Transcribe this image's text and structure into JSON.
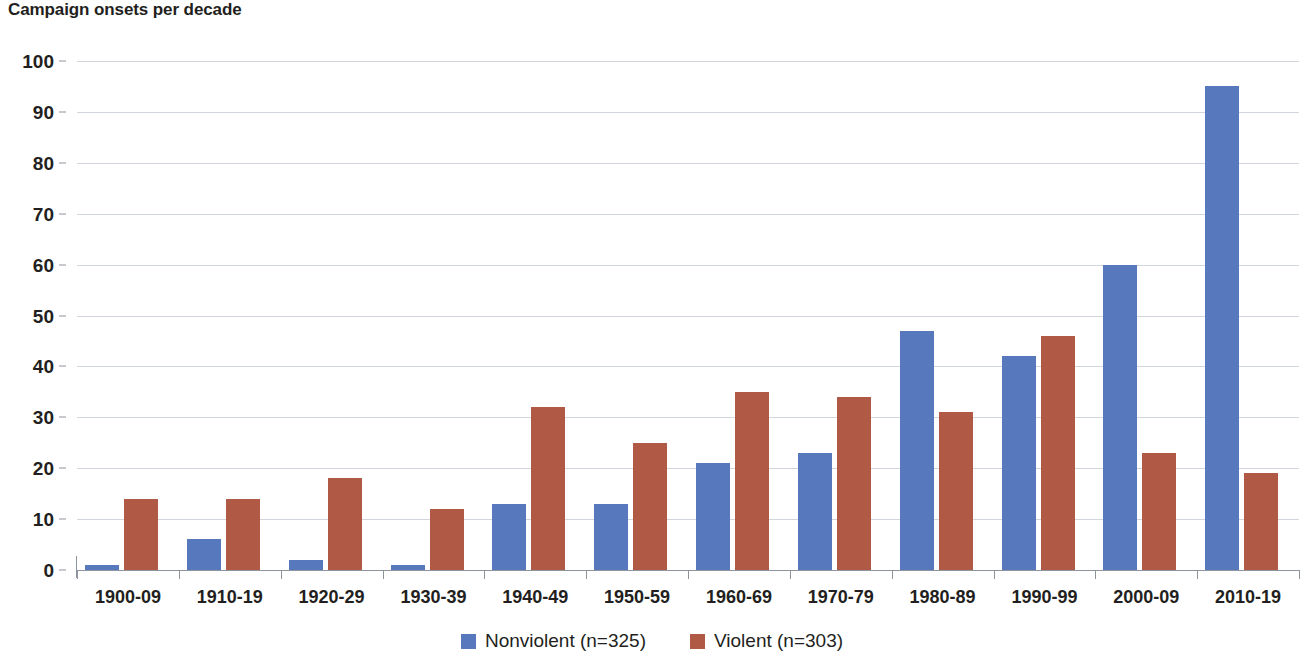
{
  "chart_data": {
    "type": "bar",
    "title": "Campaign onsets per decade",
    "xlabel": "",
    "ylabel": "",
    "ylim": [
      0,
      100
    ],
    "ytick_step": 10,
    "yticks": [
      100,
      90,
      80,
      70,
      60,
      50,
      40,
      30,
      20,
      10,
      0
    ],
    "grid": true,
    "legend_position": "bottom-center",
    "categories": [
      "1900-09",
      "1910-19",
      "1920-29",
      "1930-39",
      "1940-49",
      "1950-59",
      "1960-69",
      "1970-79",
      "1980-89",
      "1990-99",
      "2000-09",
      "2010-19"
    ],
    "series": [
      {
        "name": "Nonviolent (n=325)",
        "color": "#5878be",
        "values": [
          1,
          6,
          2,
          1,
          13,
          13,
          21,
          23,
          47,
          42,
          60,
          95
        ]
      },
      {
        "name": "Violent (n=303)",
        "color": "#b05a46",
        "values": [
          14,
          14,
          18,
          12,
          32,
          25,
          35,
          34,
          31,
          46,
          23,
          19
        ]
      }
    ]
  },
  "legend": {
    "entries": [
      {
        "label": "Nonviolent (n=325)",
        "color": "#5878be"
      },
      {
        "label": "Violent (n=303)",
        "color": "#b05a46"
      }
    ]
  },
  "colors": {
    "nonviolent": "#5878be",
    "violent": "#b05a46",
    "gridline": "#c9ced6",
    "axis": "#8e949e",
    "text": "#231f20",
    "background": "#ffffff"
  }
}
